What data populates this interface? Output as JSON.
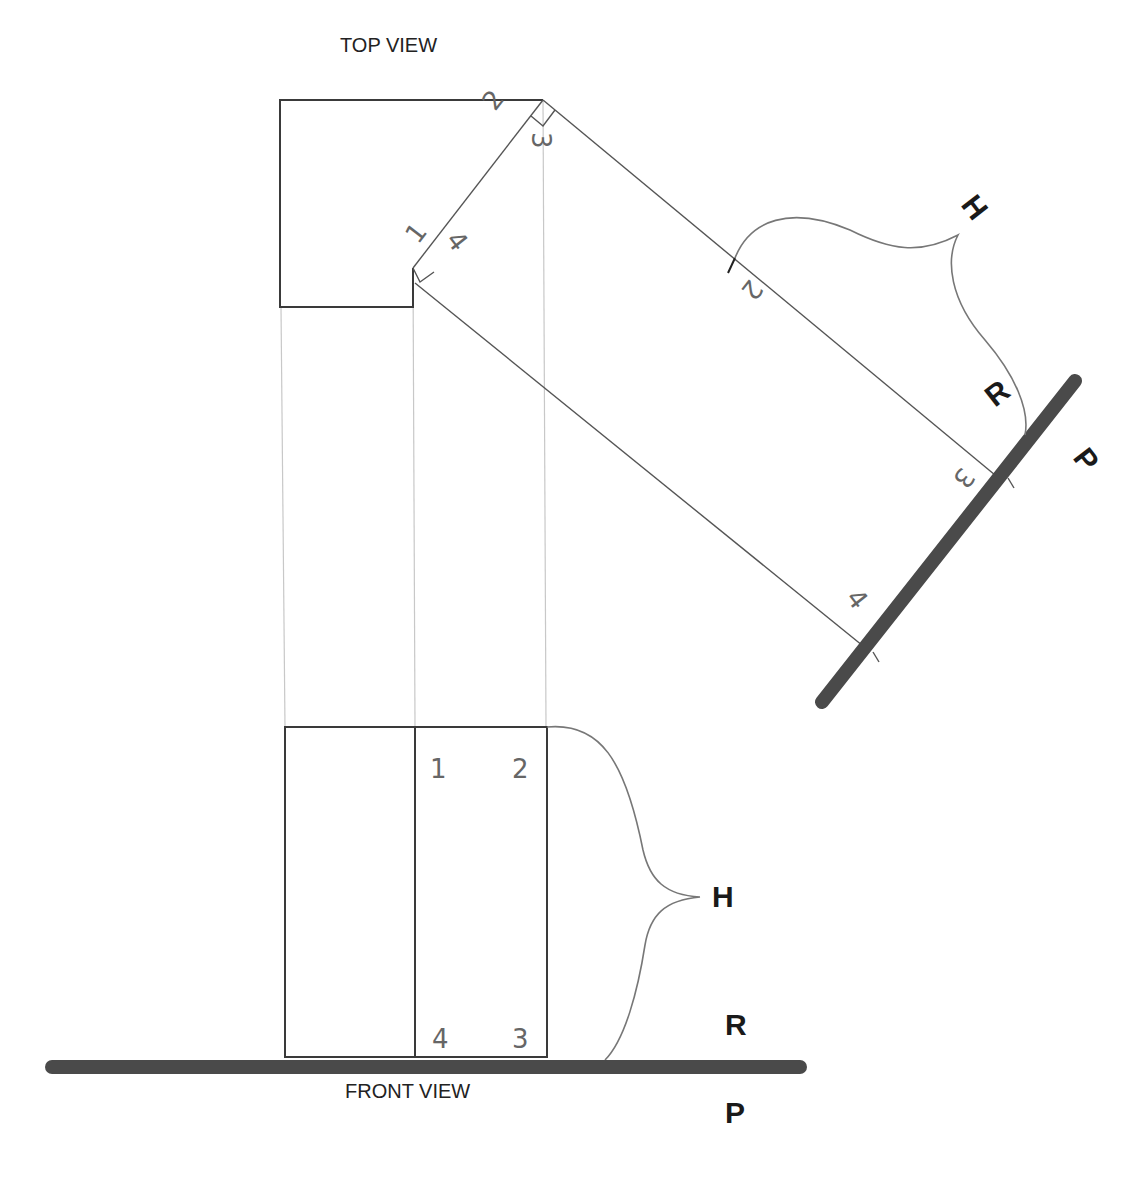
{
  "labels": {
    "top_view": "TOP VIEW",
    "front_view": "FRONT VIEW"
  },
  "top_view": {
    "points": {
      "p1": "1",
      "p2": "2",
      "p3": "3",
      "p4": "4"
    }
  },
  "auxiliary_view": {
    "points": {
      "p2": "2",
      "p3": "3",
      "p4": "4"
    },
    "height_label": "H",
    "reference_label": "R",
    "plane_label": "P"
  },
  "front_view": {
    "points": {
      "p1": "1",
      "p2": "2",
      "p3": "3",
      "p4": "4"
    },
    "height_label": "H",
    "reference_label": "R",
    "plane_label": "P"
  },
  "colors": {
    "object_line": "#3a3a3a",
    "projection_line": "#c8c8c8",
    "reference_plane": "#4a4a4a",
    "background": "#ffffff"
  }
}
